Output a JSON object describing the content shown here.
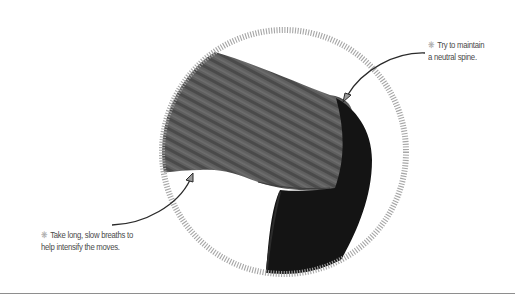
{
  "illustration": {
    "subject": "person-in-forward-bend-pose",
    "ring": {
      "style": "tick-dashed-circle",
      "color": "#a6a6a6"
    },
    "colors": {
      "shirt": "#5e5e5e",
      "pants": "#141414",
      "rule": "#8e8e8e"
    }
  },
  "callouts": [
    {
      "icon": "asterisk-icon",
      "icon_glyph": "❋",
      "lines": [
        "Try to maintain",
        "a neutral spine."
      ]
    },
    {
      "icon": "asterisk-icon",
      "icon_glyph": "❋",
      "lines": [
        "Take long, slow breaths to",
        "help intensify the moves."
      ]
    }
  ]
}
